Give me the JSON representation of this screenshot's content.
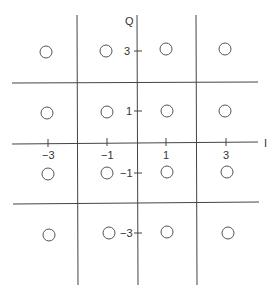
{
  "diagram": {
    "type": "16-QAM constellation",
    "axes": {
      "horizontal_label": "I",
      "vertical_label": "Q",
      "i_ticks": [
        "-3",
        "-1",
        "1",
        "3"
      ],
      "q_ticks": [
        "3",
        "1",
        "-1",
        "-3"
      ]
    },
    "points": [
      {
        "i": -3,
        "q": 3
      },
      {
        "i": -1,
        "q": 3
      },
      {
        "i": 1,
        "q": 3
      },
      {
        "i": 3,
        "q": 3
      },
      {
        "i": -3,
        "q": 1
      },
      {
        "i": -1,
        "q": 1
      },
      {
        "i": 1,
        "q": 1
      },
      {
        "i": 3,
        "q": 1
      },
      {
        "i": -3,
        "q": -1
      },
      {
        "i": -1,
        "q": -1
      },
      {
        "i": 1,
        "q": -1
      },
      {
        "i": 3,
        "q": -1
      },
      {
        "i": -3,
        "q": -3
      },
      {
        "i": -1,
        "q": -3
      },
      {
        "i": 1,
        "q": -3
      },
      {
        "i": 3,
        "q": -3
      }
    ],
    "decision_boundaries": {
      "vertical": [
        -2,
        0,
        2
      ],
      "horizontal": [
        2,
        0,
        -2
      ]
    },
    "colors": {
      "line": "#444444",
      "point": "#555555",
      "background": "#ffffff"
    }
  }
}
